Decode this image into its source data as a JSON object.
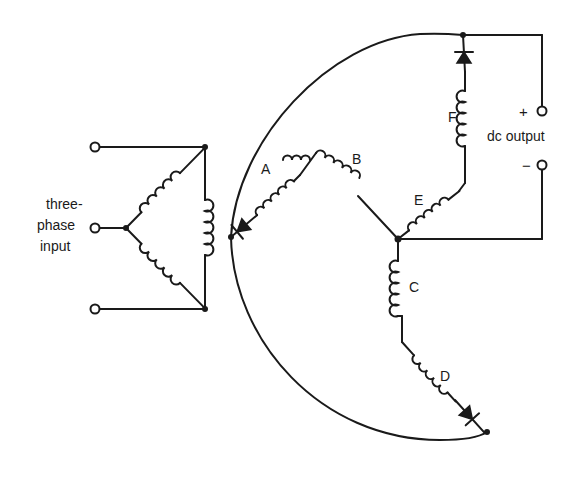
{
  "diagram": {
    "type": "three-phase full-wave rectifier schematic",
    "input_label_line1": "three-",
    "input_label_line2": "phase",
    "input_label_line3": "input",
    "output_label": "dc output",
    "output_plus": "+",
    "output_minus": "−",
    "windings": [
      {
        "id": "A",
        "label": "A"
      },
      {
        "id": "B",
        "label": "B"
      },
      {
        "id": "C",
        "label": "C"
      },
      {
        "id": "D",
        "label": "D"
      },
      {
        "id": "E",
        "label": "E"
      },
      {
        "id": "F",
        "label": "F"
      }
    ],
    "diodes": [
      "diode-A",
      "diode-D",
      "diode-F"
    ],
    "colors": {
      "ink": "#1a1a1a",
      "background": "#ffffff"
    }
  }
}
